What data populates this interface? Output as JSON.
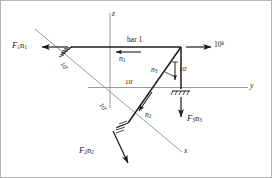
{
  "figure": {
    "type": "engineering-statics-free-body-diagram",
    "axes": {
      "z_label": "z",
      "y_label": "y",
      "x_label": "x"
    },
    "members": {
      "bar1_label": "bar 1",
      "unit_vector_1": "n",
      "unit_vector_1_sub": "1",
      "unit_vector_2": "n",
      "unit_vector_2_sub": "2",
      "unit_vector_3": "n",
      "unit_vector_3_sub": "3"
    },
    "dimensions": [
      {
        "id": "dim-upper-diagonal",
        "text": "10",
        "unit": "'"
      },
      {
        "id": "dim-lower-diagonal",
        "text": "10",
        "unit": "'"
      },
      {
        "id": "dim-horizontal-y",
        "text": "10",
        "unit": "'"
      },
      {
        "id": "dim-vertical-z",
        "text": "10",
        "unit": "'"
      }
    ],
    "loads": [
      {
        "id": "load-applied-right",
        "value": "10",
        "unit": "k",
        "direction": "right"
      }
    ],
    "reactions": [
      {
        "id": "reaction-F1",
        "symbol": "F",
        "sub": "1",
        "vector": "n",
        "vector_sub": "1",
        "direction": "left"
      },
      {
        "id": "reaction-F2",
        "symbol": "F",
        "sub": "2",
        "vector": "n",
        "vector_sub": "2",
        "direction": "down-right"
      },
      {
        "id": "reaction-F3",
        "symbol": "F",
        "sub": "3",
        "vector": "n",
        "vector_sub": "3",
        "direction": "down"
      }
    ],
    "supports": [
      {
        "id": "support-left",
        "kind": "pin-hatched"
      },
      {
        "id": "support-right",
        "kind": "pin-hatched"
      },
      {
        "id": "support-bottom",
        "kind": "pin-hatched"
      }
    ],
    "colors": {
      "line": "#1c1c1c",
      "axis": "#8c8c8c",
      "frame": "#9a9a9a",
      "background": "#ffffff"
    }
  }
}
